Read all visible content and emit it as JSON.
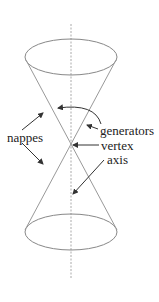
{
  "diagram": {
    "type": "double-cone",
    "labels": {
      "nappes": "nappes",
      "generators": "generators",
      "vertex": "vertex",
      "axis": "axis"
    },
    "colors": {
      "stroke": "#888888",
      "axis": "#aaaaaa",
      "arrow": "#333333",
      "text": "#222222"
    }
  }
}
